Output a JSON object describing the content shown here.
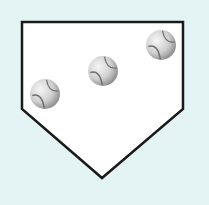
{
  "canvas": {
    "width": 209,
    "height": 205,
    "background": "#e4f3f3"
  },
  "home_plate": {
    "points": "22,22 183,22 183,109 102,178 22,109",
    "fill": "#ffffff",
    "stroke": "#1a1a1a",
    "stroke_width": 2.5
  },
  "baseballs": [
    {
      "cx": 45,
      "cy": 94,
      "r": 15
    },
    {
      "cx": 103,
      "cy": 71,
      "r": 15
    },
    {
      "cx": 161,
      "cy": 45,
      "r": 15
    }
  ],
  "colors": {
    "ball_light": "#f4f4f4",
    "ball_dark": "#9a9a9a",
    "seam": "#707070"
  }
}
